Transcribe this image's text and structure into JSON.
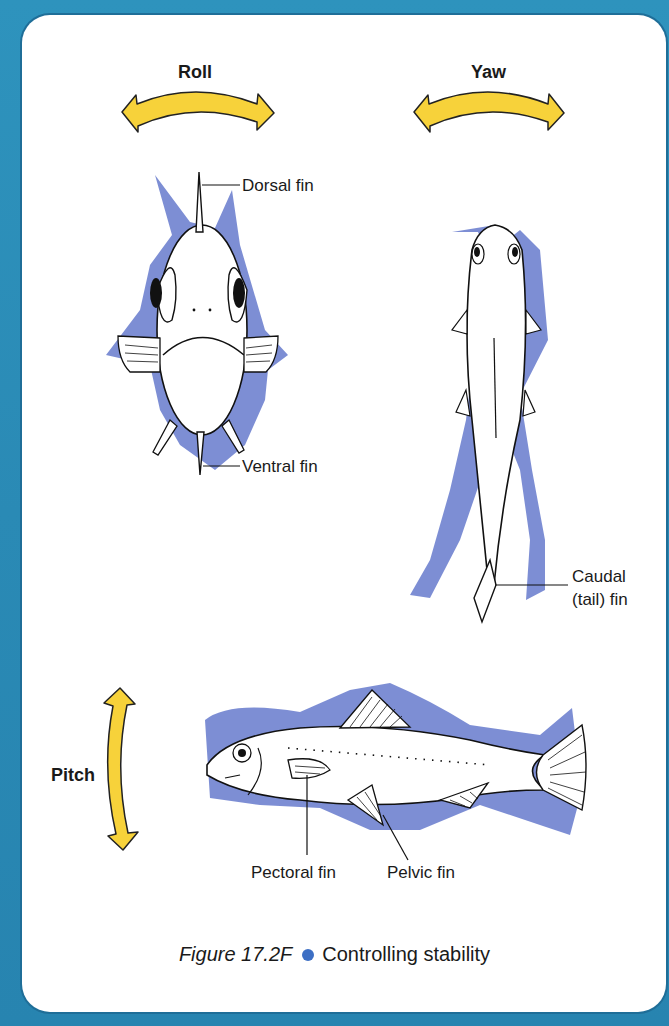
{
  "figure": {
    "number": "Figure 17.2F",
    "title": "Controlling stability",
    "bullet_color": "#3d6fc4"
  },
  "colors": {
    "frame": "#2a8ab5",
    "shadow": "#6f82cf",
    "arrow_fill": "#f7d23a"
  },
  "motions": {
    "roll": "Roll",
    "yaw": "Yaw",
    "pitch": "Pitch"
  },
  "front_view": {
    "dorsal_label": "Dorsal fin",
    "ventral_label": "Ventral fin"
  },
  "top_view": {
    "caudal_label_line1": "Caudal",
    "caudal_label_line2": "(tail) fin"
  },
  "side_view": {
    "pectoral_label": "Pectoral fin",
    "pelvic_label": "Pelvic fin"
  }
}
